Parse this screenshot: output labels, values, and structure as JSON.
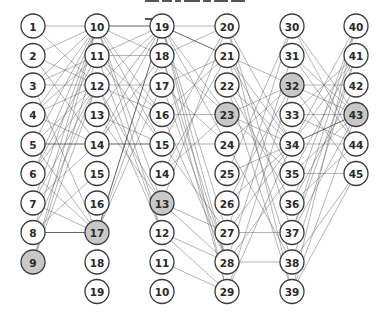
{
  "diagram": {
    "title_clipped": true,
    "colors": {
      "node_fill": "#ffffff",
      "node_highlight_fill": "#c8c8c8",
      "node_stroke": "#3a3a3a",
      "edge": "#5a5a5a",
      "background": "#ffffff"
    },
    "node_radius": 12,
    "columns": [
      {
        "x": 33,
        "y0": 26,
        "dy": 29.5,
        "labels": [
          "1",
          "2",
          "3",
          "4",
          "5",
          "6",
          "7",
          "8",
          "9"
        ],
        "highlighted": [
          "9"
        ]
      },
      {
        "x": 97,
        "y0": 26,
        "dy": 29.5,
        "labels": [
          "10",
          "11",
          "12",
          "13",
          "14",
          "15",
          "16",
          "17",
          "18",
          "19"
        ],
        "highlighted": [
          "17"
        ]
      },
      {
        "x": 162,
        "y0": 26,
        "dy": 29.5,
        "labels": [
          "19",
          "18",
          "17",
          "16",
          "15",
          "14",
          "13",
          "12",
          "11",
          "10"
        ],
        "highlighted": [
          "13"
        ]
      },
      {
        "x": 227,
        "y0": 26,
        "dy": 29.5,
        "labels": [
          "20",
          "21",
          "22",
          "23",
          "24",
          "25",
          "26",
          "27",
          "28",
          "29"
        ],
        "highlighted": [
          "23"
        ]
      },
      {
        "x": 292,
        "y0": 26,
        "dy": 29.5,
        "labels": [
          "30",
          "31",
          "32",
          "33",
          "34",
          "35",
          "36",
          "37",
          "38",
          "39"
        ],
        "highlighted": [
          "32"
        ]
      },
      {
        "x": 356,
        "y0": 26,
        "dy": 29.5,
        "labels": [
          "40",
          "41",
          "42",
          "43",
          "44",
          "45"
        ],
        "highlighted": [
          "43"
        ]
      }
    ],
    "edges": [
      [
        0,
        0,
        1,
        0
      ],
      [
        0,
        0,
        1,
        2
      ],
      [
        0,
        1,
        1,
        2
      ],
      [
        0,
        1,
        1,
        0
      ],
      [
        0,
        2,
        1,
        0
      ],
      [
        0,
        2,
        1,
        1
      ],
      [
        0,
        2,
        1,
        2
      ],
      [
        0,
        3,
        1,
        0
      ],
      [
        0,
        3,
        1,
        2
      ],
      [
        0,
        3,
        1,
        1
      ],
      [
        0,
        4,
        1,
        4
      ],
      [
        0,
        4,
        1,
        0
      ],
      [
        0,
        4,
        1,
        2
      ],
      [
        0,
        4,
        1,
        7
      ],
      [
        0,
        5,
        1,
        0
      ],
      [
        0,
        5,
        1,
        2
      ],
      [
        0,
        5,
        1,
        1
      ],
      [
        0,
        6,
        1,
        0
      ],
      [
        0,
        6,
        1,
        2
      ],
      [
        0,
        6,
        1,
        4
      ],
      [
        0,
        6,
        1,
        7
      ],
      [
        0,
        7,
        1,
        7
      ],
      [
        0,
        7,
        1,
        0
      ],
      [
        0,
        7,
        1,
        2
      ],
      [
        0,
        7,
        1,
        5
      ],
      [
        0,
        8,
        1,
        0
      ],
      [
        0,
        8,
        1,
        2
      ],
      [
        0,
        8,
        1,
        1
      ],
      [
        0,
        3,
        1,
        4
      ],
      [
        0,
        5,
        1,
        7
      ],
      [
        0,
        2,
        1,
        7
      ],
      [
        0,
        1,
        1,
        4
      ],
      [
        1,
        0,
        2,
        0
      ],
      [
        1,
        0,
        2,
        1
      ],
      [
        1,
        0,
        2,
        3
      ],
      [
        1,
        0,
        2,
        6
      ],
      [
        1,
        0,
        2,
        7
      ],
      [
        1,
        1,
        2,
        0
      ],
      [
        1,
        1,
        2,
        1
      ],
      [
        1,
        1,
        2,
        4
      ],
      [
        1,
        1,
        2,
        7
      ],
      [
        1,
        2,
        2,
        0
      ],
      [
        1,
        2,
        2,
        2
      ],
      [
        1,
        2,
        2,
        3
      ],
      [
        1,
        2,
        2,
        6
      ],
      [
        1,
        3,
        2,
        0
      ],
      [
        1,
        3,
        2,
        4
      ],
      [
        1,
        4,
        2,
        4
      ],
      [
        1,
        4,
        2,
        0
      ],
      [
        1,
        4,
        2,
        1
      ],
      [
        1,
        7,
        2,
        0
      ],
      [
        1,
        7,
        2,
        1
      ],
      [
        1,
        7,
        2,
        2
      ],
      [
        1,
        2,
        2,
        7
      ],
      [
        1,
        0,
        2,
        4
      ],
      [
        1,
        3,
        2,
        6
      ],
      [
        1,
        1,
        2,
        3
      ],
      [
        2,
        0,
        3,
        0
      ],
      [
        2,
        0,
        3,
        1
      ],
      [
        2,
        0,
        3,
        3
      ],
      [
        2,
        0,
        3,
        4
      ],
      [
        2,
        0,
        3,
        7
      ],
      [
        2,
        0,
        3,
        8
      ],
      [
        2,
        0,
        3,
        9
      ],
      [
        2,
        1,
        3,
        0
      ],
      [
        2,
        1,
        3,
        3
      ],
      [
        2,
        1,
        3,
        8
      ],
      [
        2,
        2,
        3,
        1
      ],
      [
        2,
        2,
        3,
        4
      ],
      [
        2,
        3,
        3,
        3
      ],
      [
        2,
        3,
        3,
        1
      ],
      [
        2,
        3,
        3,
        8
      ],
      [
        2,
        4,
        3,
        4
      ],
      [
        2,
        4,
        3,
        0
      ],
      [
        2,
        4,
        3,
        7
      ],
      [
        2,
        5,
        3,
        1
      ],
      [
        2,
        5,
        3,
        3
      ],
      [
        2,
        6,
        3,
        7
      ],
      [
        2,
        6,
        3,
        8
      ],
      [
        2,
        6,
        3,
        0
      ],
      [
        2,
        7,
        3,
        8
      ],
      [
        2,
        7,
        3,
        9
      ],
      [
        2,
        8,
        3,
        9
      ],
      [
        2,
        1,
        3,
        9
      ],
      [
        2,
        2,
        3,
        8
      ],
      [
        3,
        0,
        4,
        4
      ],
      [
        3,
        0,
        4,
        7
      ],
      [
        3,
        1,
        4,
        2
      ],
      [
        3,
        1,
        4,
        4
      ],
      [
        3,
        1,
        4,
        5
      ],
      [
        3,
        1,
        4,
        8
      ],
      [
        3,
        2,
        4,
        4
      ],
      [
        3,
        2,
        4,
        9
      ],
      [
        3,
        3,
        4,
        2
      ],
      [
        3,
        3,
        4,
        4
      ],
      [
        3,
        3,
        4,
        5
      ],
      [
        3,
        4,
        4,
        4
      ],
      [
        3,
        4,
        4,
        2
      ],
      [
        3,
        4,
        4,
        8
      ],
      [
        3,
        5,
        4,
        0
      ],
      [
        3,
        5,
        4,
        4
      ],
      [
        3,
        6,
        4,
        4
      ],
      [
        3,
        6,
        4,
        2
      ],
      [
        3,
        7,
        4,
        7
      ],
      [
        3,
        7,
        4,
        0
      ],
      [
        3,
        7,
        4,
        4
      ],
      [
        3,
        8,
        4,
        8
      ],
      [
        3,
        8,
        4,
        1
      ],
      [
        3,
        8,
        4,
        5
      ],
      [
        3,
        9,
        4,
        4
      ],
      [
        3,
        9,
        4,
        2
      ],
      [
        3,
        0,
        4,
        9
      ],
      [
        3,
        2,
        4,
        6
      ],
      [
        4,
        0,
        5,
        4
      ],
      [
        4,
        0,
        5,
        3
      ],
      [
        4,
        1,
        5,
        3
      ],
      [
        4,
        1,
        5,
        4
      ],
      [
        4,
        2,
        5,
        2
      ],
      [
        4,
        2,
        5,
        3
      ],
      [
        4,
        2,
        5,
        5
      ],
      [
        4,
        3,
        5,
        1
      ],
      [
        4,
        3,
        5,
        4
      ],
      [
        4,
        4,
        5,
        4
      ],
      [
        4,
        4,
        5,
        3
      ],
      [
        4,
        4,
        5,
        1
      ],
      [
        4,
        4,
        5,
        0
      ],
      [
        4,
        5,
        5,
        5
      ],
      [
        4,
        5,
        5,
        1
      ],
      [
        4,
        5,
        5,
        3
      ],
      [
        4,
        6,
        5,
        4
      ],
      [
        4,
        6,
        5,
        2
      ],
      [
        4,
        7,
        5,
        1
      ],
      [
        4,
        7,
        5,
        0
      ],
      [
        4,
        7,
        5,
        3
      ],
      [
        4,
        8,
        5,
        5
      ],
      [
        4,
        8,
        5,
        1
      ],
      [
        4,
        9,
        5,
        5
      ],
      [
        4,
        9,
        5,
        3
      ],
      [
        4,
        9,
        5,
        0
      ],
      [
        4,
        3,
        5,
        3
      ],
      [
        4,
        6,
        5,
        0
      ]
    ],
    "dark_edges": [
      [
        1,
        0,
        2,
        0
      ],
      [
        0,
        4,
        1,
        4
      ],
      [
        1,
        4,
        2,
        4
      ],
      [
        2,
        0,
        3,
        1
      ],
      [
        0,
        7,
        1,
        7
      ],
      [
        1,
        7,
        2,
        0
      ],
      [
        4,
        4,
        5,
        3
      ]
    ]
  }
}
